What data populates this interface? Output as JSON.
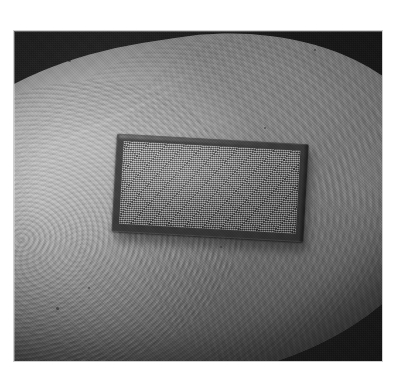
{
  "image": {
    "kind": "photograph",
    "subject": "microchip-on-fingertip",
    "description": "Black-and-white close-up photograph of a small rectangular microchip with a fine micro-array grid surface resting on the pad of a human fingertip; fingerprint ridges are visible and the background is dark and out of focus.",
    "color_mode": "grayscale",
    "alt_text": "A tiny rectangular silicon chip with a dense grid pattern sits on a fingertip",
    "frame": {
      "border_color": "#ffffff",
      "margin_left_px": 14,
      "margin_top_px": 31,
      "photo_width_px": 368,
      "photo_height_px": 330
    },
    "palette": {
      "background_dark": "#1d1d1d",
      "skin_highlight": "#b9b9b9",
      "skin_midtone": "#9a9a9a",
      "skin_shadow": "#7b7b7b",
      "chip_frame": "#3a3a3a",
      "chip_array": "#838383",
      "page_background": "#ffffff"
    },
    "regions": [
      {
        "name": "dark-backdrop",
        "label": "Out-of-focus dark background"
      },
      {
        "name": "fingertip",
        "label": "Human fingertip with fingerprint ridges"
      },
      {
        "name": "chip",
        "label": "Rectangular microchip with micro-array grid"
      }
    ],
    "chip": {
      "label": "microchip",
      "rotation_deg": 3.2,
      "width_px": 192,
      "height_px": 98,
      "surface": "micro-array grid"
    },
    "specks": [
      {
        "x": 54,
        "y": 28,
        "size": 3
      },
      {
        "x": 300,
        "y": 18,
        "size": 2
      },
      {
        "x": 206,
        "y": 215,
        "size": 2
      },
      {
        "x": 42,
        "y": 276,
        "size": 3
      },
      {
        "x": 74,
        "y": 256,
        "size": 2
      },
      {
        "x": 250,
        "y": 96,
        "size": 2
      }
    ],
    "creases": [
      {
        "name": "crease-1"
      },
      {
        "name": "crease-2"
      },
      {
        "name": "crease-3"
      }
    ]
  }
}
